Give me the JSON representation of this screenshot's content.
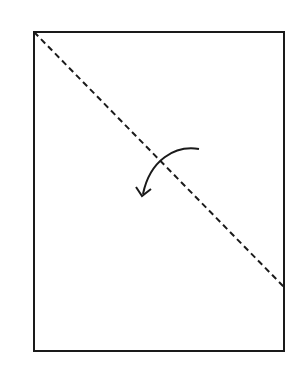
{
  "diagram": {
    "type": "paper-folding-instruction",
    "colors": {
      "background": "#ffffff",
      "stroke": "#1a1a1a"
    },
    "sheet": {
      "x": 34,
      "y": 32,
      "width": 250,
      "height": 319
    },
    "fold_line": {
      "style": "dashed",
      "from": [
        34,
        32
      ],
      "to": [
        284,
        287
      ]
    },
    "arrow": {
      "direction": "counter-clockwise",
      "from": [
        199,
        149
      ],
      "to": [
        142,
        196
      ]
    }
  }
}
